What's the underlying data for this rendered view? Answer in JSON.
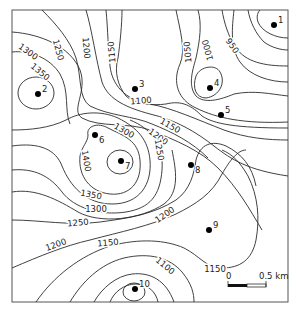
{
  "map": {
    "type": "contour map",
    "frame": {
      "x": 12,
      "y": 10,
      "width": 276,
      "height": 292
    },
    "contour_interval": 50,
    "contour_labels": [
      {
        "text": "1300",
        "x": 28,
        "y": 52,
        "rot": 35
      },
      {
        "text": "1350",
        "x": 40,
        "y": 72,
        "rot": 40
      },
      {
        "text": "1250",
        "x": 58,
        "y": 50,
        "rot": 75
      },
      {
        "text": "1200",
        "x": 86,
        "y": 48,
        "rot": 85
      },
      {
        "text": "1150",
        "x": 112,
        "y": 52,
        "rot": -95
      },
      {
        "text": "1050",
        "x": 188,
        "y": 52,
        "rot": -95
      },
      {
        "text": "1000",
        "x": 208,
        "y": 50,
        "rot": -105
      },
      {
        "text": "950",
        "x": 232,
        "y": 46,
        "rot": 55
      },
      {
        "text": "1100",
        "x": 141,
        "y": 101,
        "rot": -5
      },
      {
        "text": "1150",
        "x": 170,
        "y": 126,
        "rot": 30
      },
      {
        "text": "1200",
        "x": 158,
        "y": 137,
        "rot": 35
      },
      {
        "text": "1300",
        "x": 124,
        "y": 131,
        "rot": 30
      },
      {
        "text": "1250",
        "x": 159,
        "y": 150,
        "rot": 80
      },
      {
        "text": "1400",
        "x": 86,
        "y": 161,
        "rot": 80
      },
      {
        "text": "1350",
        "x": 91,
        "y": 195,
        "rot": 10
      },
      {
        "text": "1300",
        "x": 96,
        "y": 209,
        "rot": 0
      },
      {
        "text": "1250",
        "x": 78,
        "y": 223,
        "rot": -5
      },
      {
        "text": "1200",
        "x": 56,
        "y": 245,
        "rot": -20
      },
      {
        "text": "1200",
        "x": 165,
        "y": 215,
        "rot": -35
      },
      {
        "text": "1150",
        "x": 108,
        "y": 243,
        "rot": -5
      },
      {
        "text": "1100",
        "x": 165,
        "y": 266,
        "rot": 40
      },
      {
        "text": "1150",
        "x": 215,
        "y": 269,
        "rot": 0
      }
    ],
    "points": [
      {
        "id": "1",
        "x": 274,
        "y": 25
      },
      {
        "id": "2",
        "x": 38,
        "y": 94
      },
      {
        "id": "3",
        "x": 135,
        "y": 89
      },
      {
        "id": "4",
        "x": 210,
        "y": 88
      },
      {
        "id": "5",
        "x": 221,
        "y": 115
      },
      {
        "id": "6",
        "x": 95,
        "y": 135
      },
      {
        "id": "7",
        "x": 121,
        "y": 161
      },
      {
        "id": "8",
        "x": 191,
        "y": 165
      },
      {
        "id": "9",
        "x": 209,
        "y": 230
      },
      {
        "id": "10",
        "x": 135,
        "y": 289
      }
    ],
    "scale_bar": {
      "start_label": "0",
      "end_label": "0.5 km",
      "length_px": 38
    }
  }
}
